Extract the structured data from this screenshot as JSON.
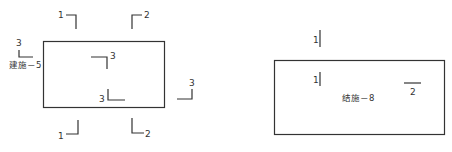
{
  "diagram": {
    "left_plan": {
      "sheet_ref": "建施－5",
      "section_marks": [
        {
          "id": "1",
          "position": "top-left",
          "label": "1"
        },
        {
          "id": "2",
          "position": "top-right",
          "label": "2"
        },
        {
          "id": "1b",
          "position": "bottom-left",
          "label": "1"
        },
        {
          "id": "2b",
          "position": "bottom-right",
          "label": "2"
        },
        {
          "id": "3a",
          "position": "left-outside",
          "label": "3"
        },
        {
          "id": "3b",
          "position": "inside-upper",
          "label": "3"
        },
        {
          "id": "3c",
          "position": "inside-lower",
          "label": "3"
        },
        {
          "id": "3d",
          "position": "right-outside",
          "label": "3"
        }
      ]
    },
    "right_plan": {
      "sheet_ref": "结施－8",
      "section_marks": [
        {
          "id": "1a",
          "position": "top-outside",
          "label": "1"
        },
        {
          "id": "1b",
          "position": "inside-top",
          "label": "1"
        },
        {
          "id": "2",
          "position": "inside-right",
          "label": "2"
        }
      ]
    }
  }
}
